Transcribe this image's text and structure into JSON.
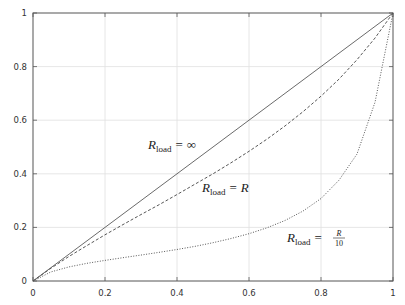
{
  "chart_data": {
    "type": "line",
    "title": "",
    "xlabel": "",
    "ylabel": "",
    "xlim": [
      0,
      1
    ],
    "ylim": [
      0,
      1
    ],
    "grid": true,
    "legend": "none",
    "x_ticks": [
      "0",
      "0.2",
      "0.4",
      "0.6",
      "0.8",
      "1"
    ],
    "y_ticks": [
      "0",
      "0.2",
      "0.4",
      "0.6",
      "0.8",
      "1"
    ],
    "x": [
      0,
      0.05,
      0.1,
      0.15,
      0.2,
      0.25,
      0.3,
      0.35,
      0.4,
      0.45,
      0.5,
      0.55,
      0.6,
      0.65,
      0.7,
      0.75,
      0.8,
      0.85,
      0.9,
      0.95,
      1.0
    ],
    "series": [
      {
        "name": "R_load = ∞",
        "style": "solid",
        "values": [
          0,
          0.05,
          0.1,
          0.15,
          0.2,
          0.25,
          0.3,
          0.35,
          0.4,
          0.45,
          0.5,
          0.55,
          0.6,
          0.65,
          0.7,
          0.75,
          0.8,
          0.85,
          0.9,
          0.95,
          1.0
        ]
      },
      {
        "name": "R_load = R",
        "style": "dashed",
        "values": [
          0,
          0.0477,
          0.0917,
          0.1323,
          0.1724,
          0.2105,
          0.2479,
          0.2845,
          0.3226,
          0.3614,
          0.4,
          0.441,
          0.4839,
          0.5294,
          0.5785,
          0.6316,
          0.6897,
          0.7532,
          0.8257,
          0.9065,
          1.0
        ]
      },
      {
        "name": "R_load = R/10",
        "style": "dotted",
        "values": [
          0,
          0.0339,
          0.0526,
          0.066,
          0.0769,
          0.087,
          0.0968,
          0.1069,
          0.1176,
          0.1292,
          0.1429,
          0.1585,
          0.1765,
          0.1985,
          0.2258,
          0.2609,
          0.3077,
          0.3762,
          0.4737,
          0.6667,
          1.0
        ]
      }
    ],
    "annotations": [
      {
        "text": "R_load = ∞",
        "x": 0.42,
        "y": 0.52
      },
      {
        "text": "R_load = R",
        "x": 0.52,
        "y": 0.34
      },
      {
        "text": "R_load = R/10",
        "x": 0.7,
        "y": 0.12
      }
    ]
  },
  "labels": {
    "inf": {
      "R": "R",
      "sub": "load",
      "eq": "=",
      "rhs": "∞"
    },
    "r": {
      "R": "R",
      "sub": "load",
      "eq": "=",
      "rhs": "R"
    },
    "r10": {
      "R": "R",
      "sub": "load",
      "eq": "=",
      "num": "R",
      "den": "10"
    }
  },
  "colors": {
    "axis": "#555555",
    "grid": "#e0e0e0",
    "line": "#444444"
  }
}
